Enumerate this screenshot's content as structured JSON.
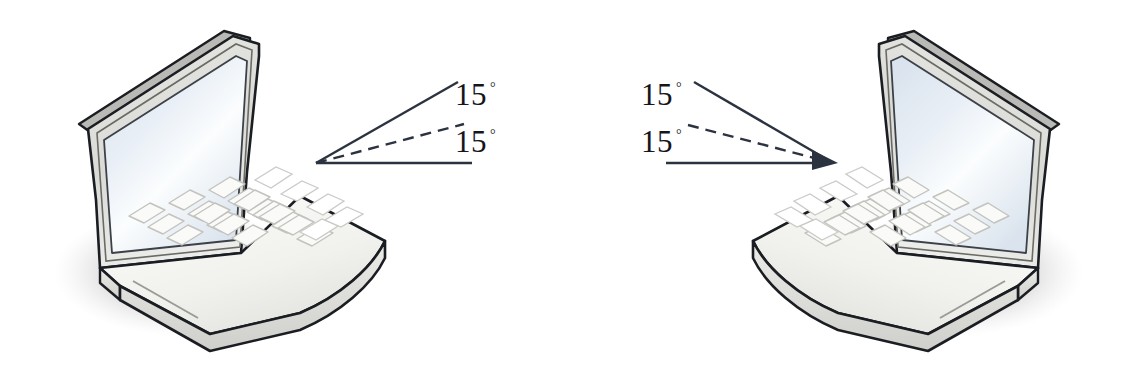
{
  "figure": {
    "background_color": "#ffffff",
    "width": 1138,
    "height": 365
  },
  "diagrams": {
    "left": {
      "name": "left-angle-diagram",
      "vertex_side": "left",
      "upper_label": {
        "value": "15",
        "degree": "°",
        "text": "15°"
      },
      "lower_label": {
        "value": "15",
        "degree": "°",
        "text": "15°"
      },
      "baseline_style": "solid",
      "upper_ray_style": "solid",
      "middle_ray_style": "dashed"
    },
    "right": {
      "name": "right-angle-diagram",
      "vertex_side": "right",
      "upper_label": {
        "value": "15",
        "degree": "°",
        "text": "15°"
      },
      "lower_label": {
        "value": "15",
        "degree": "°",
        "text": "15°"
      },
      "baseline_style": "solid",
      "upper_ray_style": "solid",
      "middle_ray_style": "dashed",
      "arrowhead": true
    }
  },
  "laptops": [
    {
      "name": "laptop-left",
      "facing": "right",
      "screen_on": true,
      "keyboard_rows": 5,
      "shadow": true
    },
    {
      "name": "laptop-right",
      "facing": "left",
      "screen_on": true,
      "keyboard_rows": 5,
      "shadow": true
    }
  ],
  "colors": {
    "outline": "#1a1d22",
    "line": "#2c3340",
    "body_light": "#f3f3f1",
    "body_mid": "#dcdcd8",
    "body_dark": "#c2c2be",
    "screen_light": "#fbfdfe",
    "screen_mid": "#dde6ef",
    "screen_edge": "#cfd9e4",
    "key_face": "#fafaf8",
    "key_shade": "#c9c9c5",
    "shadow": "#dedede",
    "text": "#14161c"
  }
}
